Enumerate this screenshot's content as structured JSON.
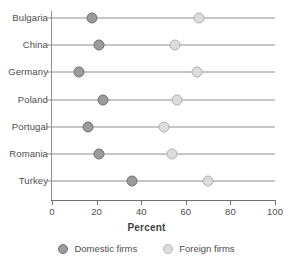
{
  "chart_data": {
    "type": "scatter",
    "title": "",
    "xlabel": "Percent",
    "ylabel": "",
    "xlim": [
      0,
      100
    ],
    "xticks": [
      0,
      20,
      40,
      60,
      80,
      100
    ],
    "xticklabels": [
      "0",
      "20",
      "40",
      "60",
      "80",
      "100"
    ],
    "grid": false,
    "legend_position": "bottom",
    "categories": [
      "Bulgaria",
      "China",
      "Germany",
      "Poland",
      "Portugal",
      "Romania",
      "Turkey"
    ],
    "series": [
      {
        "name": "Domestic firms",
        "color": "#9b9b9b",
        "values": [
          18,
          21,
          12,
          23,
          16,
          21,
          36
        ]
      },
      {
        "name": "Foreign firms",
        "color": "#dcdcdc",
        "values": [
          66,
          55,
          65,
          56,
          50,
          54,
          70
        ]
      }
    ]
  },
  "legend": {
    "items": [
      {
        "label": "Domestic firms",
        "swatch": "domestic-marker-icon"
      },
      {
        "label": "Foreign firms",
        "swatch": "foreign-marker-icon"
      }
    ]
  },
  "axis": {
    "x_title": "Percent",
    "tick_labels": [
      "0",
      "20",
      "40",
      "60",
      "80",
      "100"
    ]
  },
  "rows": [
    {
      "category": "Bulgaria",
      "domestic": 18,
      "foreign": 66
    },
    {
      "category": "China",
      "domestic": 21,
      "foreign": 55
    },
    {
      "category": "Germany",
      "domestic": 12,
      "foreign": 65
    },
    {
      "category": "Poland",
      "domestic": 23,
      "foreign": 56
    },
    {
      "category": "Portugal",
      "domestic": 16,
      "foreign": 50
    },
    {
      "category": "Romania",
      "domestic": 21,
      "foreign": 54
    },
    {
      "category": "Turkey",
      "domestic": 36,
      "foreign": 70
    }
  ]
}
